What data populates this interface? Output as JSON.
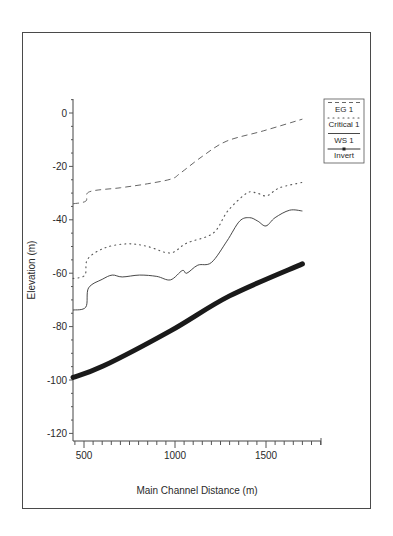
{
  "chart_data": {
    "type": "line",
    "title": "",
    "xlabel": "Main Channel Distance (m)",
    "ylabel": "Elevation (m)",
    "xlim": [
      440,
      1800
    ],
    "ylim": [
      -122,
      5
    ],
    "x_ticks": [
      500,
      1000,
      1500
    ],
    "y_ticks": [
      0,
      -20,
      -40,
      -60,
      -80,
      -100,
      -120
    ],
    "grid": false,
    "legend_position": "right-top",
    "series": [
      {
        "name": "EG 1",
        "style": "dashed",
        "color": "#555555",
        "points": [
          [
            440,
            -34
          ],
          [
            510,
            -33
          ],
          [
            530,
            -29.5
          ],
          [
            700,
            -28
          ],
          [
            850,
            -26.5
          ],
          [
            980,
            -24.7
          ],
          [
            1030,
            -22.5
          ],
          [
            1155,
            -16
          ],
          [
            1285,
            -10.5
          ],
          [
            1485,
            -6.7
          ],
          [
            1700,
            -2.3
          ]
        ]
      },
      {
        "name": "Critical 1",
        "style": "dotted",
        "color": "#555555",
        "points": [
          [
            440,
            -62
          ],
          [
            505,
            -60.7
          ],
          [
            520,
            -54.7
          ],
          [
            615,
            -50.5
          ],
          [
            740,
            -49
          ],
          [
            850,
            -50
          ],
          [
            975,
            -52.4
          ],
          [
            1065,
            -48.7
          ],
          [
            1210,
            -45
          ],
          [
            1290,
            -36.7
          ],
          [
            1395,
            -30
          ],
          [
            1450,
            -30
          ],
          [
            1505,
            -31
          ],
          [
            1575,
            -28
          ],
          [
            1700,
            -26
          ]
        ]
      },
      {
        "name": "WS 1",
        "style": "solid",
        "color": "#333333",
        "points": [
          [
            440,
            -73.8
          ],
          [
            510,
            -72.7
          ],
          [
            525,
            -65.5
          ],
          [
            600,
            -62.3
          ],
          [
            655,
            -60.7
          ],
          [
            710,
            -61.4
          ],
          [
            805,
            -60.7
          ],
          [
            900,
            -61.2
          ],
          [
            975,
            -62.5
          ],
          [
            1040,
            -59
          ],
          [
            1065,
            -60
          ],
          [
            1125,
            -57
          ],
          [
            1200,
            -56
          ],
          [
            1285,
            -48
          ],
          [
            1355,
            -40.5
          ],
          [
            1410,
            -39.2
          ],
          [
            1455,
            -40.5
          ],
          [
            1500,
            -42.3
          ],
          [
            1550,
            -39.2
          ],
          [
            1630,
            -36.4
          ],
          [
            1700,
            -36.7
          ]
        ]
      },
      {
        "name": "Invert",
        "style": "thick-solid",
        "color": "#1a1a1a",
        "points": [
          [
            440,
            -99
          ],
          [
            605,
            -94.8
          ],
          [
            975,
            -81.6
          ],
          [
            1300,
            -68.5
          ],
          [
            1700,
            -56.5
          ]
        ]
      }
    ]
  },
  "legend": {
    "items": [
      "EG 1",
      "Critical 1",
      "WS 1",
      "Invert"
    ]
  },
  "axes": {
    "x_label": "Main Channel Distance (m)",
    "y_label": "Elevation (m)"
  }
}
